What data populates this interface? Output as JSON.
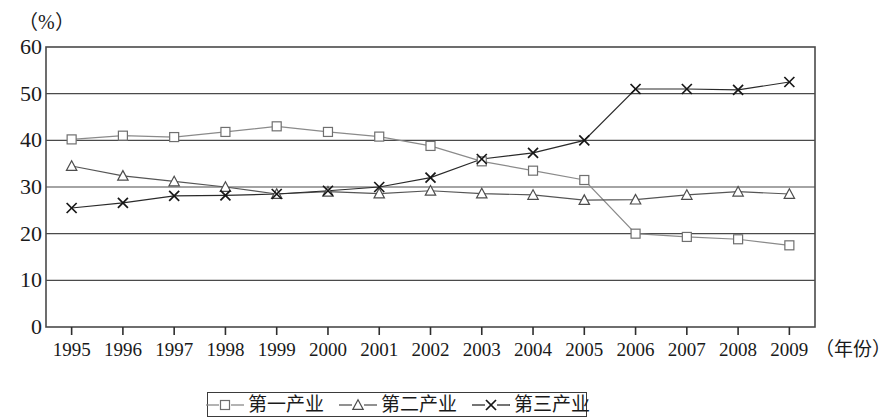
{
  "chart_data": {
    "type": "line",
    "title": "",
    "unit_label": "（%）",
    "xlabel": "（年份）",
    "ylabel": "",
    "categories": [
      "1995",
      "1996",
      "1997",
      "1998",
      "1999",
      "2000",
      "2001",
      "2002",
      "2003",
      "2004",
      "2005",
      "2006",
      "2007",
      "2008",
      "2009"
    ],
    "x": [
      1995,
      1996,
      1997,
      1998,
      1999,
      2000,
      2001,
      2002,
      2003,
      2004,
      2005,
      2006,
      2007,
      2008,
      2009
    ],
    "ylim": [
      0,
      60
    ],
    "yticks": [
      "0",
      "10",
      "20",
      "30",
      "40",
      "50",
      "60"
    ],
    "ytick_values": [
      0,
      10,
      20,
      30,
      40,
      50,
      60
    ],
    "grid": true,
    "legend_position": "bottom",
    "series": [
      {
        "name": "第一产业",
        "marker": "square",
        "color": "#8a8a8a",
        "values": [
          40.2,
          41.0,
          40.7,
          41.8,
          43.0,
          41.8,
          40.8,
          38.8,
          35.5,
          33.5,
          31.5,
          20.0,
          19.3,
          18.8,
          17.5
        ]
      },
      {
        "name": "第二产业",
        "marker": "triangle",
        "color": "#555555",
        "values": [
          34.5,
          32.4,
          31.2,
          30.0,
          28.5,
          29.0,
          28.6,
          29.2,
          28.6,
          28.3,
          27.2,
          27.3,
          28.3,
          29.0,
          28.5
        ]
      },
      {
        "name": "第三产业",
        "marker": "cross",
        "color": "#2a2a2a",
        "values": [
          25.5,
          26.6,
          28.1,
          28.2,
          28.5,
          29.2,
          30.0,
          32.0,
          36.0,
          37.3,
          40.0,
          51.0,
          51.0,
          50.8,
          52.5
        ]
      }
    ]
  }
}
